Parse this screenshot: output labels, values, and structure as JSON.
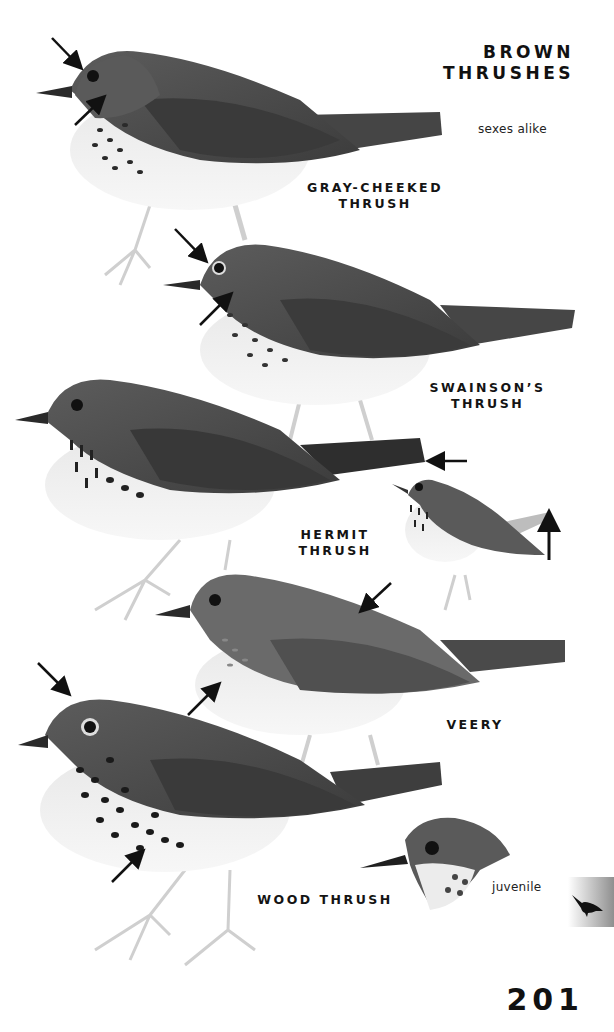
{
  "page": {
    "section_title": [
      "BROWN",
      "THRUSHES"
    ],
    "note_sexes": "sexes alike",
    "page_number": "201",
    "section_tab_icon": "thrush-silhouette-icon"
  },
  "species": [
    {
      "name_lines": [
        "GRAY-CHEEKED",
        "THRUSH"
      ],
      "arrows": [
        "crown/eye-ring",
        "cheek"
      ]
    },
    {
      "name_lines": [
        "SWAINSON’S",
        "THRUSH"
      ],
      "arrows": [
        "eye-ring",
        "cheek"
      ]
    },
    {
      "name_lines": [
        "HERMIT THRUSH"
      ],
      "arrows": [
        "rufous tail",
        "tail-cocking"
      ]
    },
    {
      "name_lines": [
        "VEERY"
      ],
      "arrows": [
        "back",
        "breast spots"
      ]
    },
    {
      "name_lines": [
        "WOOD THRUSH"
      ],
      "arrows": [
        "crown",
        "bold spots"
      ]
    }
  ],
  "annotations": {
    "juvenile": "juvenile"
  },
  "colors": {
    "ink": "#141414",
    "bird_dark": "#4a4a4a",
    "bird_mid": "#6e6e6e",
    "bird_light": "#ededed",
    "tab_gray": "#8f8f8f"
  }
}
